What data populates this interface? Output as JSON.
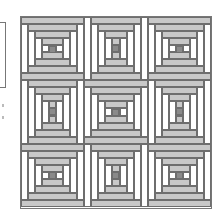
{
  "diagram": {
    "title": "",
    "pattern_name": "Courthouse Steps quilt layout",
    "grid": {
      "rows": 3,
      "cols": 3
    },
    "colors": {
      "light_strip": "#ffffff",
      "medium_strip": "#c8c8c8",
      "center_square": "#8a8a8a",
      "outline": "#6e6e6e",
      "background": "#ffffff"
    },
    "blocks": [
      {
        "row": 1,
        "col": 1,
        "orientation": "horizontal"
      },
      {
        "row": 1,
        "col": 2,
        "orientation": "vertical"
      },
      {
        "row": 1,
        "col": 3,
        "orientation": "horizontal"
      },
      {
        "row": 2,
        "col": 1,
        "orientation": "vertical"
      },
      {
        "row": 2,
        "col": 2,
        "orientation": "horizontal"
      },
      {
        "row": 2,
        "col": 3,
        "orientation": "vertical"
      },
      {
        "row": 3,
        "col": 1,
        "orientation": "horizontal"
      },
      {
        "row": 3,
        "col": 2,
        "orientation": "vertical"
      },
      {
        "row": 3,
        "col": 3,
        "orientation": "horizontal"
      }
    ],
    "rounds_per_block": 4
  }
}
